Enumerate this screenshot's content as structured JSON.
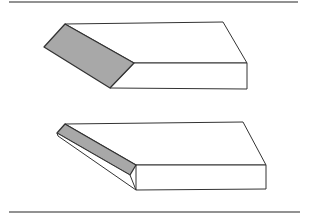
{
  "figure": {
    "colors": {
      "background": "#ffffff",
      "stroke": "#333333",
      "bevel_fill": "#a8a8a8",
      "face_fill": "#ffffff",
      "rule": "#6e6e6e"
    },
    "rules": [
      {
        "name": "top-rule",
        "x1": 9,
        "y1": 2,
        "x2": 298,
        "y2": 2
      },
      {
        "name": "bottom-rule",
        "x1": 9,
        "y1": 212,
        "x2": 300,
        "y2": 212
      }
    ],
    "blocks": [
      {
        "name": "single-bevel-block",
        "top_face": "65,24 223,22 247,63 134,63",
        "front_face": "134,63 247,63 247,89 110,88",
        "bevel_face": "65,24 134,63 110,88 44,47"
      },
      {
        "name": "double-bevel-block",
        "top_face": "65,124 243,122 266,165 136,165",
        "front_face": "136,165 266,165 266,189 136,190",
        "bevel_face": "65,124 136,165 130,175 57,133",
        "lower_bevel_face": "57,133 130,175 136,190 58,136"
      }
    ]
  }
}
